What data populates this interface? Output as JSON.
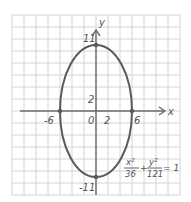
{
  "chart_data": {
    "type": "line",
    "title": "",
    "equation": {
      "x_num": "x²",
      "x_den": "36",
      "plus": "+",
      "y_num": "y²",
      "y_den": "121",
      "equals": "= 1"
    },
    "xlabel": "x",
    "ylabel": "y",
    "xlim": [
      -14,
      14
    ],
    "ylim": [
      -14,
      14
    ],
    "grid": true,
    "grid_step": 2,
    "curve": {
      "type": "ellipse",
      "center": [
        0,
        0
      ],
      "a": 6,
      "b": 11
    },
    "vertices": [
      {
        "x": 0,
        "y": 11,
        "label": "11"
      },
      {
        "x": 0,
        "y": -11,
        "label": "-11"
      },
      {
        "x": -6,
        "y": 0,
        "label": "-6"
      },
      {
        "x": 6,
        "y": 0,
        "label": "6"
      }
    ],
    "tick_labels": {
      "origin": "0",
      "x_tick": "2",
      "y_tick": "2"
    }
  },
  "colors": {
    "grid": "#d4d4d4",
    "axis": "#6a6a6a",
    "curve": "#5a5a5a",
    "text": "#555555"
  }
}
